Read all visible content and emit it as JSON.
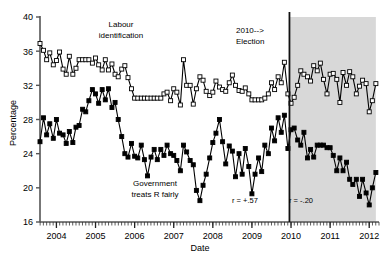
{
  "chart_data": {
    "type": "line",
    "title": "",
    "xlabel": "Date",
    "ylabel": "Percentage",
    "ylim": [
      16,
      40
    ],
    "xlim": [
      2003.58,
      2012.25
    ],
    "yticks": [
      16,
      20,
      24,
      28,
      32,
      36,
      40
    ],
    "xticks": [
      2004,
      2005,
      2006,
      2007,
      2008,
      2009,
      2010,
      2011,
      2012
    ],
    "grid": false,
    "legend_position": "none",
    "series": [
      {
        "name": "Labour identification",
        "marker": "open-square",
        "color": "#000000",
        "x": [
          2003.58,
          2003.67,
          2003.75,
          2003.83,
          2003.92,
          2004.0,
          2004.08,
          2004.17,
          2004.25,
          2004.33,
          2004.42,
          2004.5,
          2004.58,
          2004.67,
          2004.75,
          2004.83,
          2004.92,
          2005.0,
          2005.08,
          2005.17,
          2005.25,
          2005.33,
          2005.42,
          2005.5,
          2005.58,
          2005.67,
          2005.75,
          2005.83,
          2005.92,
          2006.0,
          2006.08,
          2006.17,
          2006.25,
          2006.33,
          2006.42,
          2006.5,
          2006.58,
          2006.67,
          2006.75,
          2006.83,
          2006.92,
          2007.0,
          2007.08,
          2007.17,
          2007.25,
          2007.33,
          2007.42,
          2007.5,
          2007.58,
          2007.67,
          2007.75,
          2007.83,
          2007.92,
          2008.0,
          2008.08,
          2008.17,
          2008.25,
          2008.33,
          2008.42,
          2008.5,
          2008.58,
          2008.67,
          2008.75,
          2008.83,
          2008.92,
          2009.0,
          2009.08,
          2009.17,
          2009.25,
          2009.33,
          2009.42,
          2009.5,
          2009.58,
          2009.67,
          2009.75,
          2009.83,
          2009.92,
          2010.0,
          2010.08,
          2010.17,
          2010.25,
          2010.33,
          2010.42,
          2010.5,
          2010.58,
          2010.67,
          2010.75,
          2010.83,
          2010.92,
          2011.0,
          2011.08,
          2011.17,
          2011.25,
          2011.33,
          2011.42,
          2011.5,
          2011.58,
          2011.67,
          2011.75,
          2011.83,
          2011.92,
          2012.0,
          2012.08,
          2012.17
        ],
        "y": [
          36.9,
          36.1,
          35.0,
          35.8,
          34.4,
          34.9,
          35.9,
          33.9,
          33.3,
          35.4,
          33.3,
          34.0,
          35.0,
          35.0,
          35.0,
          35.0,
          34.6,
          35.2,
          34.4,
          33.8,
          35.0,
          33.8,
          34.5,
          33.3,
          33.0,
          33.9,
          34.3,
          32.9,
          31.6,
          30.5,
          30.5,
          30.5,
          30.5,
          30.5,
          30.5,
          30.5,
          30.5,
          30.5,
          31.0,
          31.2,
          30.2,
          31.6,
          31.2,
          29.7,
          35.0,
          32.0,
          32.0,
          29.8,
          31.6,
          33.0,
          32.6,
          31.3,
          30.8,
          31.2,
          32.5,
          31.8,
          31.5,
          31.3,
          32.3,
          33.2,
          32.0,
          31.4,
          31.3,
          31.7,
          31.0,
          30.3,
          30.3,
          30.3,
          30.3,
          30.5,
          31.0,
          32.3,
          31.5,
          33.0,
          32.3,
          34.7,
          31.0,
          29.9,
          30.6,
          32.0,
          33.7,
          33.3,
          33.0,
          32.5,
          34.3,
          33.7,
          34.6,
          32.7,
          31.0,
          33.3,
          33.4,
          32.7,
          30.0,
          33.5,
          32.0,
          33.6,
          33.0,
          31.0,
          31.9,
          32.6,
          32.2,
          28.9,
          30.2,
          32.2
        ]
      },
      {
        "name": "Government treats R fairly",
        "marker": "filled-square",
        "color": "#000000",
        "x": [
          2003.58,
          2003.67,
          2003.75,
          2003.83,
          2003.92,
          2004.0,
          2004.08,
          2004.17,
          2004.25,
          2004.33,
          2004.42,
          2004.5,
          2004.58,
          2004.67,
          2004.75,
          2004.83,
          2004.92,
          2005.0,
          2005.08,
          2005.17,
          2005.25,
          2005.33,
          2005.42,
          2005.5,
          2005.58,
          2005.67,
          2005.75,
          2005.83,
          2005.92,
          2006.0,
          2006.08,
          2006.17,
          2006.25,
          2006.33,
          2006.42,
          2006.5,
          2006.58,
          2006.67,
          2006.75,
          2006.83,
          2006.92,
          2007.0,
          2007.08,
          2007.17,
          2007.25,
          2007.33,
          2007.42,
          2007.5,
          2007.58,
          2007.67,
          2007.75,
          2007.83,
          2007.92,
          2008.0,
          2008.08,
          2008.17,
          2008.25,
          2008.33,
          2008.42,
          2008.5,
          2008.58,
          2008.67,
          2008.75,
          2008.83,
          2008.92,
          2009.0,
          2009.08,
          2009.17,
          2009.25,
          2009.33,
          2009.42,
          2009.5,
          2009.58,
          2009.67,
          2009.75,
          2009.83,
          2009.92,
          2010.0,
          2010.08,
          2010.17,
          2010.25,
          2010.33,
          2010.42,
          2010.5,
          2010.58,
          2010.67,
          2010.75,
          2010.83,
          2010.92,
          2011.0,
          2011.08,
          2011.17,
          2011.25,
          2011.33,
          2011.42,
          2011.5,
          2011.58,
          2011.67,
          2011.75,
          2011.83,
          2011.92,
          2012.0,
          2012.08,
          2012.17
        ],
        "y": [
          25.4,
          28.2,
          26.2,
          27.5,
          25.8,
          28.0,
          26.4,
          26.2,
          25.2,
          26.6,
          25.3,
          27.1,
          27.3,
          29.2,
          28.9,
          30.2,
          31.5,
          31.0,
          29.9,
          31.5,
          30.3,
          31.6,
          29.4,
          30.0,
          28.0,
          26.0,
          24.0,
          23.6,
          25.2,
          23.7,
          23.5,
          25.0,
          23.3,
          21.4,
          23.6,
          24.5,
          23.3,
          24.5,
          23.8,
          25.0,
          24.0,
          23.8,
          23.2,
          22.0,
          25.0,
          24.2,
          23.2,
          22.7,
          19.7,
          18.5,
          20.3,
          21.6,
          23.5,
          25.3,
          26.4,
          28.0,
          25.4,
          22.8,
          24.9,
          24.3,
          21.3,
          24.0,
          21.6,
          24.6,
          22.5,
          19.3,
          21.6,
          23.5,
          21.9,
          25.0,
          24.0,
          27.0,
          25.5,
          28.2,
          26.5,
          28.5,
          24.6,
          26.8,
          27.0,
          25.6,
          25.0,
          26.5,
          23.5,
          24.5,
          23.6,
          25.0,
          25.0,
          25.0,
          24.7,
          24.7,
          23.8,
          22.0,
          23.5,
          22.0,
          23.0,
          21.0,
          20.4,
          21.0,
          19.0,
          21.0,
          19.4,
          18.0,
          20.0,
          21.8
        ]
      }
    ],
    "annotations": [
      {
        "name": "labour-identification-label",
        "text_line1": "Labour",
        "text_line2": "identification",
        "x": 0.3,
        "y": 0.1
      },
      {
        "name": "government-fairly-label",
        "text_line1": "Government",
        "text_line2": "treats R fairly",
        "x": 0.4,
        "y": 0.74
      },
      {
        "name": "election-label",
        "text_line1": "2010-->",
        "text_line2": "Election",
        "x": 0.67,
        "y": 0.1
      },
      {
        "name": "correlation-pre",
        "text": "r = +.57"
      },
      {
        "name": "correlation-post",
        "text": "r = -.20"
      }
    ],
    "event_line": {
      "label": "2010 Election",
      "x": 2009.96
    },
    "shaded_region": {
      "from": 2009.96,
      "to": 2012.17,
      "color": "#d8d8d8"
    }
  },
  "axes": {
    "ylabel": "Percentage",
    "xlabel": "Date",
    "yticks": [
      "40",
      "36",
      "32",
      "28",
      "24",
      "20",
      "16"
    ],
    "xticks": [
      "2004",
      "2005",
      "2006",
      "2007",
      "2008",
      "2009",
      "2010",
      "2011",
      "2012"
    ]
  },
  "labels": {
    "labour_line1": "Labour",
    "labour_line2": "identification",
    "government_line1": "Government",
    "government_line2": "treats R fairly",
    "election_line1": "2010-->",
    "election_line2": "Election",
    "r_pre": "r = +.57",
    "r_post": "r = -.20"
  },
  "colors": {
    "shade": "#d8d8d8",
    "line": "#1a1a1a",
    "axis": "#555555"
  }
}
